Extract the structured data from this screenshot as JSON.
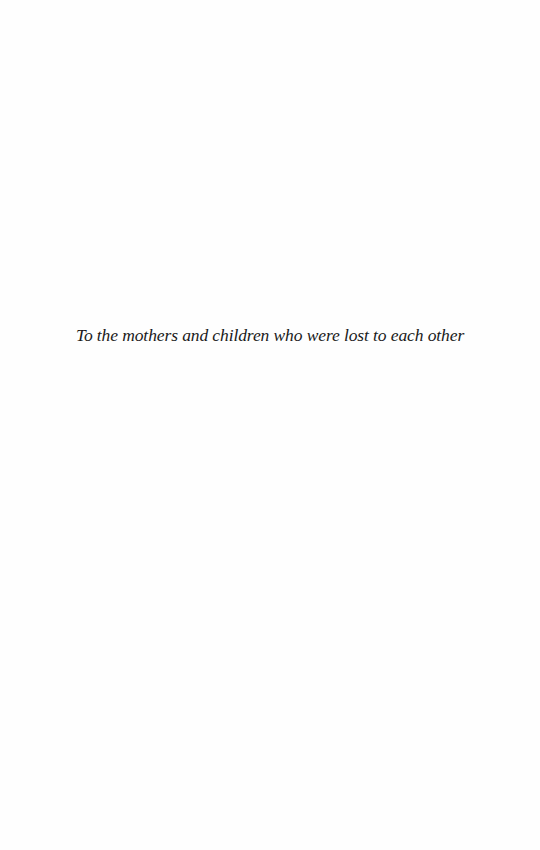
{
  "page": {
    "type": "dedication",
    "background_color": "#fefefe",
    "text_color": "#1a1a1a"
  },
  "dedication": {
    "text": "To the mothers and children who were lost to each other"
  }
}
